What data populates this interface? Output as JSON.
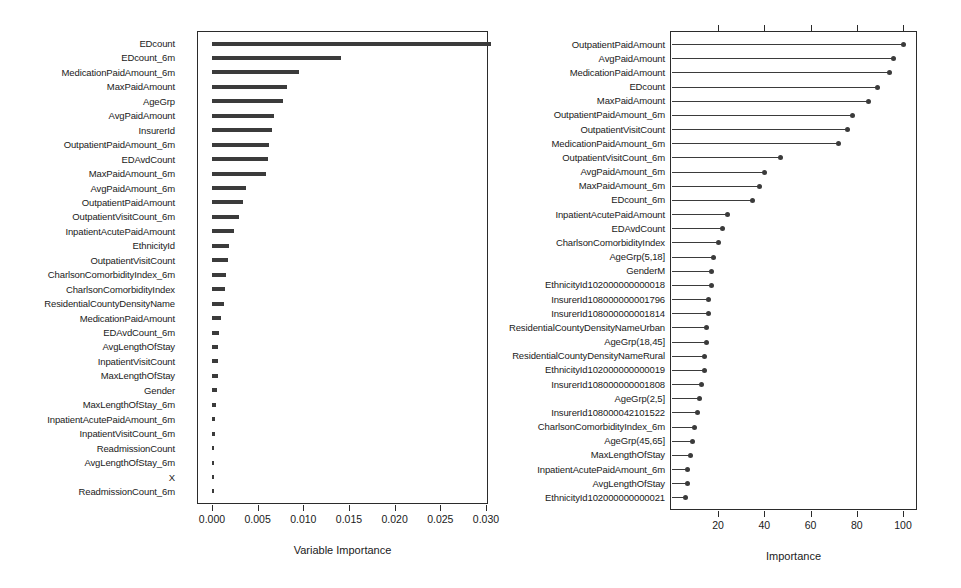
{
  "figure": {
    "background": "#ffffff",
    "ink": "#3b3b3b"
  },
  "chart_data": [
    {
      "id": "left",
      "type": "bar",
      "orientation": "horizontal",
      "title": "",
      "xlabel": "Variable Importance",
      "ylabel": "",
      "xlim": [
        0.0,
        0.0315
      ],
      "grid": false,
      "legend": null,
      "xticks": [
        "0.000",
        "0.005",
        "0.010",
        "0.015",
        "0.020",
        "0.025",
        "0.030"
      ],
      "xtickvalues": [
        0.0,
        0.005,
        0.01,
        0.015,
        0.02,
        0.025,
        0.03
      ],
      "categories": [
        "EDcount",
        "EDcount_6m",
        "MedicationPaidAmount_6m",
        "MaxPaidAmount",
        "AgeGrp",
        "AvgPaidAmount",
        "InsurerId",
        "OutpatientPaidAmount_6m",
        "EDAvdCount",
        "MaxPaidAmount_6m",
        "AvgPaidAmount_6m",
        "OutpatientPaidAmount",
        "OutpatientVisitCount_6m",
        "InpatientAcutePaidAmount",
        "EthnicityId",
        "OutpatientVisitCount",
        "CharlsonComorbidityIndex_6m",
        "CharlsonComorbidityIndex",
        "ResidentialCountyDensityName",
        "MedicationPaidAmount",
        "EDAvdCount_6m",
        "AvgLengthOfStay",
        "InpatientVisitCount",
        "MaxLengthOfStay",
        "Gender",
        "MaxLengthOfStay_6m",
        "InpatientAcutePaidAmount_6m",
        "InpatientVisitCount_6m",
        "ReadmissionCount",
        "AvgLengthOfStay_6m",
        "X",
        "ReadmissionCount_6m"
      ],
      "values": [
        0.0305,
        0.0141,
        0.0095,
        0.0082,
        0.0078,
        0.0068,
        0.0066,
        0.0062,
        0.0061,
        0.0059,
        0.0037,
        0.0034,
        0.003,
        0.0024,
        0.0019,
        0.0018,
        0.0015,
        0.0014,
        0.0013,
        0.001,
        0.0008,
        0.0007,
        0.0007,
        0.0007,
        0.0006,
        0.0004,
        0.0003,
        0.0003,
        0.0002,
        0.0002,
        0.0002,
        0.0001
      ]
    },
    {
      "id": "right",
      "type": "bar",
      "orientation": "horizontal-lollipop",
      "title": "",
      "xlabel": "Importance",
      "ylabel": "",
      "xlim": [
        0,
        108
      ],
      "grid": false,
      "legend": null,
      "xticks": [
        "20",
        "40",
        "60",
        "80",
        "100"
      ],
      "xtickvalues": [
        20,
        40,
        60,
        80,
        100
      ],
      "categories": [
        "OutpatientPaidAmount",
        "AvgPaidAmount",
        "MedicationPaidAmount",
        "EDcount",
        "MaxPaidAmount",
        "OutpatientPaidAmount_6m",
        "OutpatientVisitCount",
        "MedicationPaidAmount_6m",
        "OutpatientVisitCount_6m",
        "AvgPaidAmount_6m",
        "MaxPaidAmount_6m",
        "EDcount_6m",
        "InpatientAcutePaidAmount",
        "EDAvdCount",
        "CharlsonComorbidityIndex",
        "AgeGrp(5,18]",
        "GenderM",
        "EthnicityId102000000000018",
        "InsurerId108000000001796",
        "InsurerId108000000001814",
        "ResidentialCountyDensityNameUrban",
        "AgeGrp(18,45]",
        "ResidentialCountyDensityNameRural",
        "EthnicityId102000000000019",
        "InsurerId108000000001808",
        "AgeGrp(2,5]",
        "InsurerId108000042101522",
        "CharlsonComorbidityIndex_6m",
        "AgeGrp(45,65]",
        "MaxLengthOfStay",
        "InpatientAcutePaidAmount_6m",
        "AvgLengthOfStay",
        "EthnicityId102000000000021"
      ],
      "values": [
        100,
        96,
        94,
        89,
        85,
        78,
        76,
        72,
        47,
        40,
        38,
        35,
        24,
        22,
        20,
        18,
        17,
        17,
        16,
        16,
        15,
        15,
        14,
        14,
        13,
        12,
        11,
        10,
        9,
        8,
        7,
        7,
        6
      ]
    }
  ]
}
